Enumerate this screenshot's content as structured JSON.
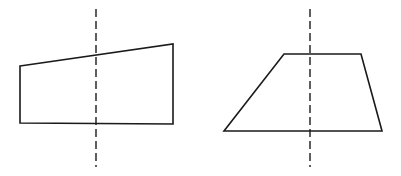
{
  "figures": [
    {
      "name": "quadrilateral-left",
      "description": "Right trapezoid with sloped top edge and dashed vertical line",
      "points": [
        [
          20,
          66
        ],
        [
          173,
          44
        ],
        [
          173,
          124
        ],
        [
          20,
          123
        ]
      ],
      "dashed_line": {
        "x": 96,
        "y1": 9,
        "y2": 167
      }
    },
    {
      "name": "trapezoid-right",
      "description": "Trapezoid with horizontal parallel sides and dashed vertical line",
      "points": [
        [
          284,
          54
        ],
        [
          361,
          54
        ],
        [
          382,
          131
        ],
        [
          224,
          131
        ]
      ],
      "dashed_line": {
        "x": 310,
        "y1": 9,
        "y2": 167
      }
    }
  ],
  "colors": {
    "stroke": "#1a1a1a",
    "background": "#ffffff"
  }
}
